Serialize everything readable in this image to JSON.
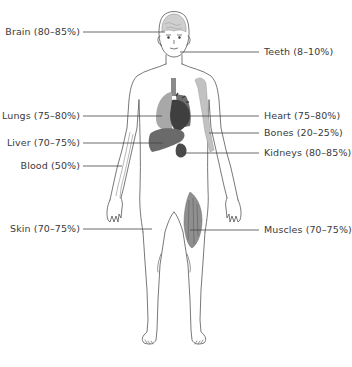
{
  "diagram": {
    "colors": {
      "outline": "#555555",
      "leader_line": "#444444",
      "label_text": "#3a3a3a",
      "organ_dark": "#3d3d3d",
      "organ_mid": "#777777",
      "organ_light": "#b5b5b5",
      "bone": "#c2c2c2"
    },
    "labels_left": [
      {
        "id": "brain",
        "text": "Brain (80–85%)",
        "y": 32
      },
      {
        "id": "lungs",
        "text": "Lungs (75–80%)",
        "y": 116
      },
      {
        "id": "liver",
        "text": "Liver (70–75%)",
        "y": 143
      },
      {
        "id": "blood",
        "text": "Blood (50%)",
        "y": 166
      },
      {
        "id": "skin",
        "text": "Skin (70–75%)",
        "y": 229
      }
    ],
    "labels_right": [
      {
        "id": "teeth",
        "text": "Teeth (8–10%)",
        "y": 52
      },
      {
        "id": "heart",
        "text": "Heart (75–80%)",
        "y": 116
      },
      {
        "id": "bones",
        "text": "Bones (20–25%)",
        "y": 133
      },
      {
        "id": "kidneys",
        "text": "Kidneys (80–85%)",
        "y": 153
      },
      {
        "id": "muscles",
        "text": "Muscles (70–75%)",
        "y": 230
      }
    ]
  }
}
